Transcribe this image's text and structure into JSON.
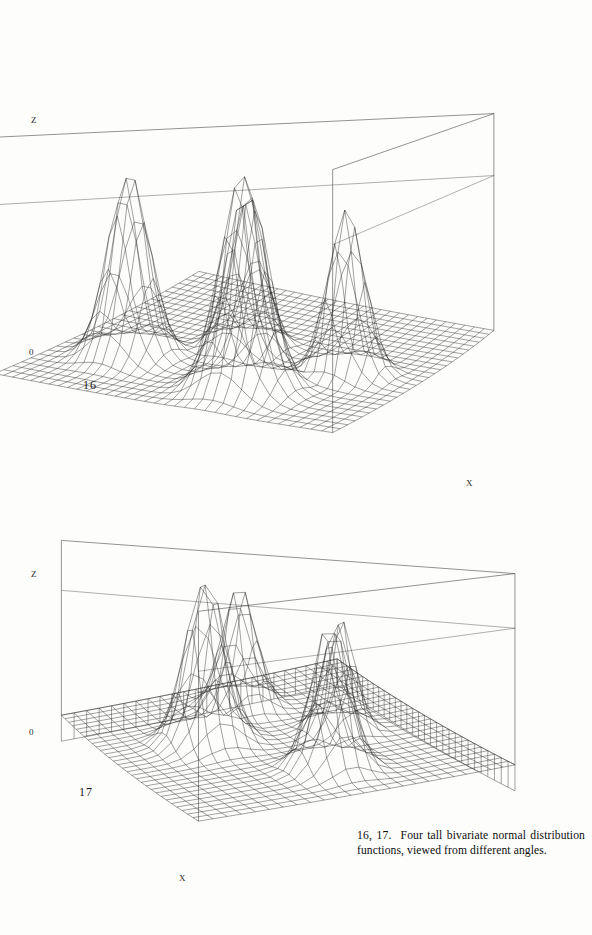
{
  "page": {
    "background_color": "#fdfdfc",
    "ink_color": "#1a1a1a",
    "width": 592,
    "height": 935
  },
  "caption": {
    "number": "16, 17.",
    "text": "Four tall bivariate normal distribution functions, viewed from different angles."
  },
  "figures": [
    {
      "id": "16",
      "number_label": "16",
      "z_axis_label": "Z",
      "origin_label": "0",
      "x_axis_label": "X",
      "view": "first viewing angle"
    },
    {
      "id": "17",
      "number_label": "17",
      "z_axis_label": "Z",
      "origin_label": "0",
      "x_axis_label": "X",
      "view": "second viewing angle, rotated, with pedestal base"
    }
  ],
  "chart_data": [
    {
      "type": "surface",
      "id": "16",
      "title": "",
      "xlabel": "X",
      "ylabel": "",
      "zlabel": "Z",
      "grid": true,
      "legend": "none",
      "description": "Four tall bivariate normal distribution functions on a rectangular mesh, wireframe surface, viewed from an oblique angle",
      "mesh": {
        "nx": 34,
        "ny": 26
      },
      "xlim": [
        0,
        1
      ],
      "ylim": [
        0,
        1
      ],
      "zlim": [
        0,
        1
      ],
      "peaks": [
        {
          "name": "peak-a",
          "cx": 0.22,
          "cy": 0.3,
          "amplitude": 0.9,
          "sigma": 0.058
        },
        {
          "name": "peak-b",
          "cx": 0.46,
          "cy": 0.52,
          "amplitude": 0.8,
          "sigma": 0.05
        },
        {
          "name": "peak-c",
          "cx": 0.64,
          "cy": 0.2,
          "amplitude": 1.0,
          "sigma": 0.062
        },
        {
          "name": "peak-d",
          "cx": 0.8,
          "cy": 0.46,
          "amplitude": 0.78,
          "sigma": 0.05
        }
      ],
      "camera": {
        "azimuth": 28,
        "elevation": 16,
        "perspective": 0.42,
        "base": "flat"
      }
    },
    {
      "type": "surface",
      "id": "17",
      "title": "",
      "xlabel": "X",
      "ylabel": "",
      "zlabel": "Z",
      "grid": true,
      "legend": "none",
      "description": "The same four tall bivariate normal distribution functions viewed from a different angle, drawn on a raised pedestal slab",
      "mesh": {
        "nx": 30,
        "ny": 24
      },
      "xlim": [
        0,
        1
      ],
      "ylim": [
        0,
        1
      ],
      "zlim": [
        0,
        1
      ],
      "peaks": [
        {
          "name": "peak-a",
          "cx": 0.2,
          "cy": 0.52,
          "amplitude": 0.8,
          "sigma": 0.055
        },
        {
          "name": "peak-b",
          "cx": 0.42,
          "cy": 0.3,
          "amplitude": 1.0,
          "sigma": 0.062
        },
        {
          "name": "peak-c",
          "cx": 0.52,
          "cy": 0.7,
          "amplitude": 0.72,
          "sigma": 0.047
        },
        {
          "name": "peak-d",
          "cx": 0.78,
          "cy": 0.52,
          "amplitude": 0.86,
          "sigma": 0.055
        }
      ],
      "camera": {
        "azimuth": 58,
        "elevation": 19,
        "perspective": 0.4,
        "base": "pedestal"
      }
    }
  ]
}
